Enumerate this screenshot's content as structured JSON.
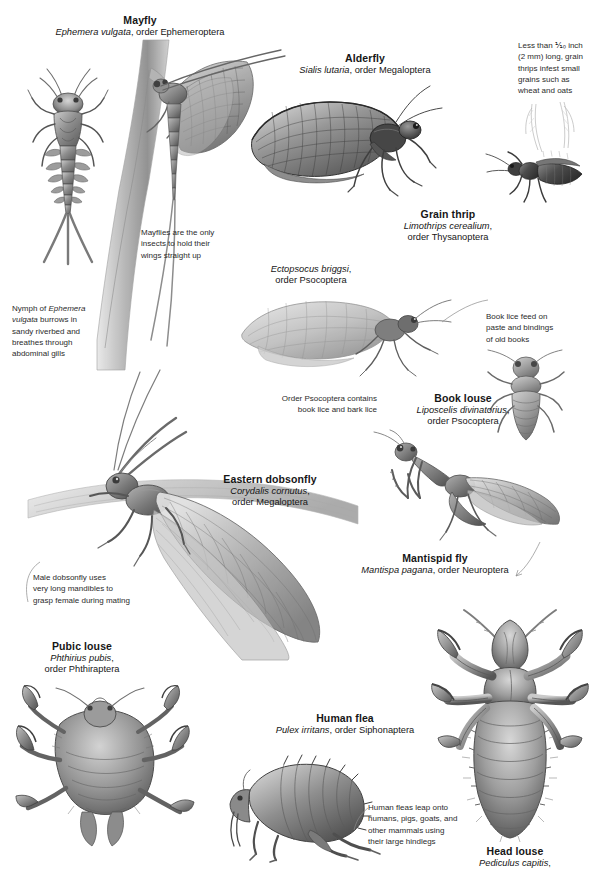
{
  "page": {
    "background_color": "#ffffff",
    "ink_color": "#161616",
    "note_color": "#2b2b2b"
  },
  "specimens": [
    {
      "id": "mayfly",
      "common": "Mayfly",
      "sci_italic": "Ephemera vulgata",
      "sci_rest": ", order Ephemeroptera",
      "icon": "mayfly-illustration"
    },
    {
      "id": "alderfly",
      "common": "Alderfly",
      "sci_italic": "Sialis lutaria",
      "sci_rest": ", order Megaloptera",
      "icon": "alderfly-illustration"
    },
    {
      "id": "grain-thrip",
      "common": "Grain thrip",
      "sci_italic": "Limothrips cerealium",
      "sci_rest": ",",
      "sci_line2": "order Thysanoptera",
      "icon": "grain-thrip-illustration"
    },
    {
      "id": "book-louse",
      "common": "Book louse",
      "sci_italic": "Liposcelis divinatorius",
      "sci_rest": ",",
      "sci_line2": "order Psocoptera",
      "icon": "book-louse-illustration"
    },
    {
      "id": "eastern-dobsonfly",
      "common": "Eastern dobsonfly",
      "sci_italic": "Corydalis cornutus",
      "sci_rest": ",",
      "sci_line2": "order Megaloptera",
      "icon": "eastern-dobsonfly-illustration"
    },
    {
      "id": "mantispid-fly",
      "common": "Mantispid fly",
      "sci_italic": "Mantispa pagana",
      "sci_rest": ", order Neuroptera",
      "icon": "mantispid-fly-illustration"
    },
    {
      "id": "pubic-louse",
      "common": "Pubic louse",
      "sci_italic": "Phthirius pubis",
      "sci_rest": ",",
      "sci_line2": "order Phthiraptera",
      "icon": "pubic-louse-illustration"
    },
    {
      "id": "human-flea",
      "common": "Human flea",
      "sci_italic": "Pulex irritans",
      "sci_rest": ", order Siphonaptera",
      "icon": "human-flea-illustration"
    },
    {
      "id": "head-louse",
      "common": "Head louse",
      "sci_italic": "Pediculus capitis",
      "sci_rest": ",",
      "icon": "head-louse-illustration"
    }
  ],
  "unlabeled_figures": [
    {
      "id": "ectopsocus",
      "sci_italic": "Ectopsocus briggsi",
      "sci_rest": ",",
      "sci_line2": "order Psocoptera",
      "icon": "barklouse-illustration"
    }
  ],
  "annotations": [
    {
      "id": "mayfly-wings-note",
      "lines": [
        "Mayflies are the only",
        "insects to hold their",
        "wings straight up"
      ]
    },
    {
      "id": "mayfly-nymph-note",
      "line1_pre": "Nymph of ",
      "line1_italic": "Ephemera",
      "line2_italic": "vulgata",
      "line2_post": " burrows in",
      "line3": "sandy riverbed and",
      "line4": "breathes through",
      "line5": "abdominal gills"
    },
    {
      "id": "grain-thrip-note",
      "lines": [
        "Less than ⅒ inch",
        "(2 mm) long, grain",
        "thrips infest small",
        "grains such as",
        "wheat and oats"
      ]
    },
    {
      "id": "psocoptera-note",
      "lines": [
        "Order Psocoptera contains",
        "book lice and bark lice"
      ]
    },
    {
      "id": "book-lice-feed-note",
      "lines": [
        "Book lice feed on",
        "paste and bindings",
        "of old books"
      ]
    },
    {
      "id": "dobsonfly-mandibles-note",
      "lines": [
        "Male dobsonfly uses",
        "very long mandibles to",
        "grasp female during mating"
      ]
    },
    {
      "id": "human-flea-note",
      "lines": [
        "Human fleas leap onto",
        "humans, pigs, goats, and",
        "other mammals using",
        "their large hindlegs"
      ]
    }
  ]
}
